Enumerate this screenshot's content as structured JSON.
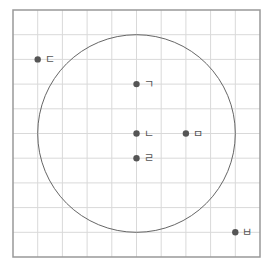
{
  "grid": {
    "cols": 10,
    "rows": 10,
    "left": 13,
    "top": 10,
    "cell": 24.7,
    "line_color": "#d9d9d9",
    "border_color": "#999999"
  },
  "circle": {
    "center": [
      5,
      5
    ],
    "radius_cells": 4,
    "stroke": "#666666"
  },
  "points": [
    {
      "id": "d",
      "label": "ㄷ",
      "gx": 1,
      "gy": 2
    },
    {
      "id": "g",
      "label": "ㄱ",
      "gx": 5,
      "gy": 3
    },
    {
      "id": "n",
      "label": "ㄴ",
      "gx": 5,
      "gy": 5
    },
    {
      "id": "m",
      "label": "ㅁ",
      "gx": 7,
      "gy": 5
    },
    {
      "id": "r",
      "label": "ㄹ",
      "gx": 5,
      "gy": 6
    },
    {
      "id": "b",
      "label": "ㅂ",
      "gx": 9,
      "gy": 9
    }
  ],
  "point_color": "#555555"
}
